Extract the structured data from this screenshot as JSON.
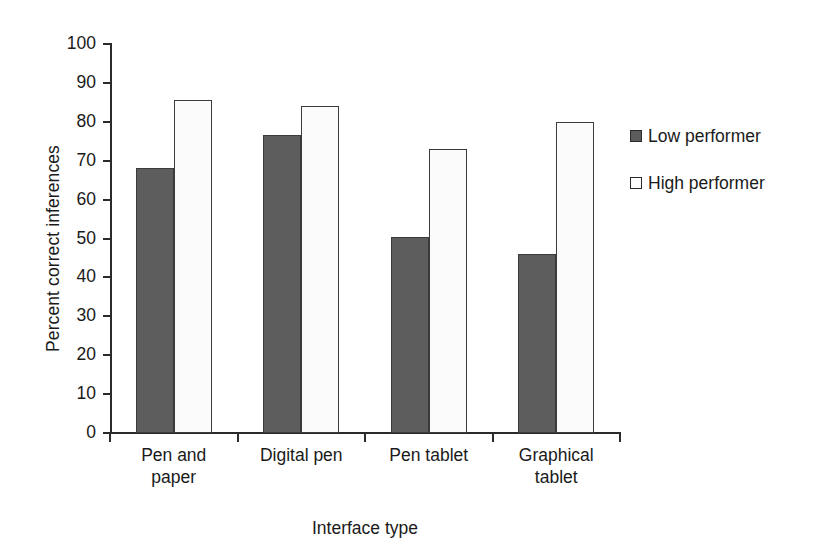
{
  "chart_data": {
    "type": "bar",
    "title": "",
    "xlabel": "Interface type",
    "ylabel": "Percent correct inferences",
    "categories": [
      "Pen and paper",
      "Digital pen",
      "Pen tablet",
      "Graphical tablet"
    ],
    "category_lines": [
      [
        "Pen and",
        "paper"
      ],
      [
        "Digital pen",
        ""
      ],
      [
        "Pen tablet",
        ""
      ],
      [
        "Graphical",
        "tablet"
      ]
    ],
    "series": [
      {
        "name": "Low performer",
        "values": [
          68,
          76.5,
          50.5,
          46
        ],
        "color": "#5d5d5d"
      },
      {
        "name": "High performer",
        "values": [
          85.5,
          84,
          73,
          80
        ],
        "color": "#ffffff"
      }
    ],
    "ylim": [
      0,
      100
    ],
    "ytick_labels": [
      "100",
      "90",
      "80",
      "70",
      "60",
      "50",
      "40",
      "30",
      "20",
      "10",
      "0"
    ],
    "ytick_values": [
      100,
      90,
      80,
      70,
      60,
      50,
      40,
      30,
      20,
      10,
      0
    ],
    "grid": false,
    "legend_position": "right"
  },
  "legend": {
    "entries": [
      {
        "label": "Low performer",
        "swatch": "filled-dark-gray-square"
      },
      {
        "label": "High performer",
        "swatch": "open-white-square"
      }
    ]
  }
}
